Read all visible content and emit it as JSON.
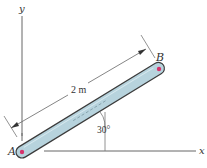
{
  "figure": {
    "axes": {
      "x_label": "x",
      "y_label": "y"
    },
    "points": {
      "a_label": "A",
      "b_label": "B"
    },
    "length_label": "2 m",
    "angle_label": "30°",
    "colors": {
      "rod_fill": "#b7d3dd",
      "rod_stroke": "#3b3b3b",
      "pin": "#d6336c",
      "line": "#555555"
    }
  }
}
